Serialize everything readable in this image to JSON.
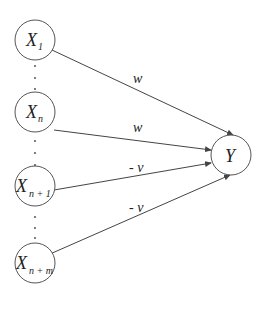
{
  "diagram": {
    "inputs": [
      {
        "id": "x1",
        "main": "X",
        "sub": "1",
        "cx": 35,
        "cy": 40
      },
      {
        "id": "xn",
        "main": "X",
        "sub": "n",
        "cx": 35,
        "cy": 112
      },
      {
        "id": "xn1",
        "main": "X",
        "sub": "n + 1",
        "cx": 35,
        "cy": 186
      },
      {
        "id": "xnm",
        "main": "X",
        "sub": "n + m",
        "cx": 35,
        "cy": 263
      }
    ],
    "output": {
      "id": "y",
      "label": "Y",
      "cx": 231,
      "cy": 155
    },
    "edges": [
      {
        "from": "x1",
        "weight": "w"
      },
      {
        "from": "xn",
        "weight": "w"
      },
      {
        "from": "xn1",
        "weight": "- v"
      },
      {
        "from": "xnm",
        "weight": "- v"
      }
    ],
    "ellipsis": "⋮"
  }
}
